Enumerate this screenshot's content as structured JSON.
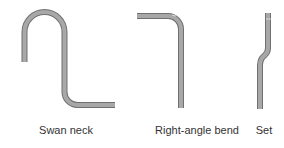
{
  "figure": {
    "colors": {
      "bar_outline": "#707070",
      "bar_fill": "#a8a8a8",
      "label_text": "#333333",
      "background": "#ffffff"
    },
    "items": [
      {
        "id": "swan-neck",
        "label": "Swan neck"
      },
      {
        "id": "right-angle-bend",
        "label": "Right-angle bend"
      },
      {
        "id": "set",
        "label": "Set"
      }
    ]
  }
}
